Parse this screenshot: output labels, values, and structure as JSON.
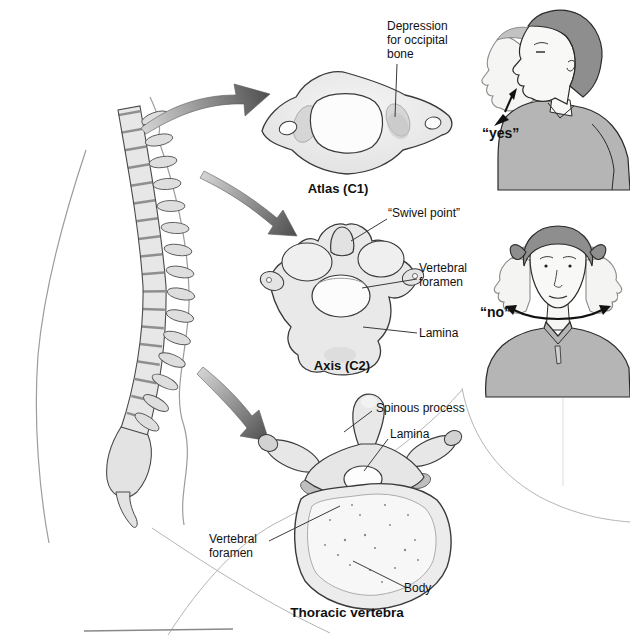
{
  "colors": {
    "background": "#ffffff",
    "text": "#111111",
    "leader_line": "#3a3a3a",
    "bone_outline": "#3a3a3a",
    "bone_fill": "#e9e9e9",
    "arrow_light": "#d4d4d4",
    "arrow_dark": "#4f4f4f",
    "hair_gray": "#8e8e8e",
    "shirt_gray": "#b5b5b5"
  },
  "diagram": {
    "atlas": {
      "caption": "Atlas (C1)",
      "label_depression": "Depression for occipital bone"
    },
    "axis": {
      "caption": "Axis (C2)",
      "label_swivel": "“Swivel point”",
      "label_foramen": "Vertebral foramen",
      "label_lamina": "Lamina"
    },
    "thoracic": {
      "caption": "Thoracic vertebra",
      "label_spinous": "Spinous process",
      "label_lamina": "Lamina",
      "label_foramen": "Vertebral foramen",
      "label_body": "Body"
    },
    "motion": {
      "yes_caption": "“yes”",
      "no_caption": "“no”"
    }
  }
}
